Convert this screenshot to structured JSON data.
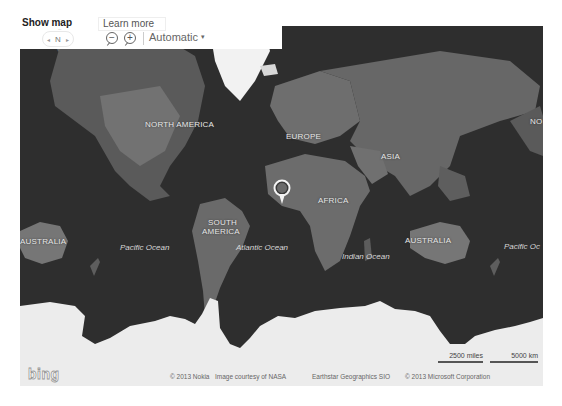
{
  "toolbar": {
    "show_map_label": "Show map",
    "learn_more_label": "Learn more",
    "compass": {
      "north_label": "N",
      "left_icon": "rotate-left-icon",
      "right_icon": "rotate-right-icon"
    },
    "zoom_out_icon": "zoom-out-icon",
    "zoom_in_icon": "zoom-in-icon",
    "zoom_out_symbol": "−",
    "zoom_in_symbol": "+",
    "map_style_value": "Automatic",
    "map_style_caret": "▾"
  },
  "map": {
    "type": "aerial-grayscale-world",
    "continent_labels": [
      {
        "id": "north-america",
        "text": "NORTH AMERICA"
      },
      {
        "id": "europe",
        "text": "EUROPE"
      },
      {
        "id": "asia",
        "text": "ASIA"
      },
      {
        "id": "africa",
        "text": "AFRICA"
      },
      {
        "id": "south-america-1",
        "text": "SOUTH"
      },
      {
        "id": "south-america-2",
        "text": "AMERICA"
      },
      {
        "id": "australia-left",
        "text": "AUSTRALIA"
      },
      {
        "id": "australia-right",
        "text": "AUSTRALIA"
      },
      {
        "id": "north-america-cropped",
        "text": "NO"
      }
    ],
    "ocean_labels": [
      {
        "id": "pacific-left",
        "text": "Pacific Ocean"
      },
      {
        "id": "atlantic",
        "text": "Atlantic Ocean"
      },
      {
        "id": "indian",
        "text": "Indian Ocean"
      },
      {
        "id": "pacific-right",
        "text": "Pacific Oc"
      }
    ],
    "pin": {
      "icon": "location-pin-icon"
    },
    "scale": {
      "miles_label": "2500 miles",
      "km_label": "5000 km"
    },
    "branding": "bing",
    "attributions": [
      "© 2013 Nokia",
      "Image courtesy of NASA",
      "Earthstar Geographics SIO",
      "© 2013 Microsoft Corporation"
    ]
  },
  "colors": {
    "ocean": "#2e2e2e",
    "land": "#6a6a6a",
    "ice": "#ededed",
    "label": "#e8e8e8"
  }
}
